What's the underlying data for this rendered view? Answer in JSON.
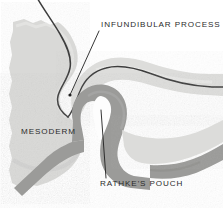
{
  "figure": {
    "kind": "embryology-sagittal-section",
    "background_color": "#ffffff",
    "palette": {
      "background": "#ffffff",
      "mesoderm_fill": "#d9d9d7",
      "mesoderm_fill_light": "#e2e2e0",
      "mesoderm_shadow": "#c9c9c7",
      "ectoderm_band": "#9b9b99",
      "ectoderm_band_dark": "#8e8e8c",
      "lumen": "#fdfdfd",
      "outline_dark": "#3a3a3a",
      "leader_line": "#1f1f1f",
      "text": "#2b2b2b"
    }
  },
  "labels": [
    {
      "id": "infundibular-process",
      "text": "INFUNDIBULAR PROCESS",
      "x": 101,
      "y": 27,
      "anchor": "start",
      "leader": {
        "from_x": 99,
        "from_y": 31,
        "to_x": 70,
        "to_y": 95
      }
    },
    {
      "id": "mesoderm",
      "text": "MESODERM",
      "x": 21,
      "y": 134,
      "anchor": "start",
      "leader": null
    },
    {
      "id": "rathkes-pouch",
      "text": "RATHKE'S POUCH",
      "x": 100,
      "y": 186,
      "anchor": "start",
      "leader": {
        "from_x": 106,
        "from_y": 178,
        "to_x": 101,
        "to_y": 110
      }
    }
  ],
  "structures": [
    {
      "id": "mesoderm-mass",
      "name": "Mesoderm",
      "tone": "light-gray",
      "description": "Large stippled light-gray mass filling the left half of the field with a ragged torn left margin."
    },
    {
      "id": "neural-floor-line",
      "name": "Neural floor outline",
      "tone": "dark-outline",
      "description": "Dark S-shaped contour descending from the top edge and curving into the infundibular recess."
    },
    {
      "id": "infundibular-process",
      "name": "Infundibular process",
      "tone": "light-gray",
      "description": "Downward neural evagination from the diencephalic floor that meets the apex of Rathke's pouch."
    },
    {
      "id": "rathkes-pouch-wall",
      "name": "Rathke's pouch",
      "tone": "mid-gray",
      "description": "Mid-gray epithelial band rising from the oral ectoderm and enclosing a narrow white lumen."
    },
    {
      "id": "rathkes-pouch-lumen",
      "name": "Pouch lumen",
      "tone": "white",
      "description": "White teardrop-shaped cavity inside the pouch wall."
    },
    {
      "id": "oral-ectoderm-band",
      "name": "Oral ectoderm",
      "tone": "mid-gray",
      "description": "Mid-gray band sweeping from the lower left across to the right edge beneath the pouch."
    },
    {
      "id": "upper-tissue-band",
      "name": "Upper tissue band",
      "tone": "light-gray",
      "description": "Light-gray layer extending to the right edge above the dark contour line."
    }
  ]
}
